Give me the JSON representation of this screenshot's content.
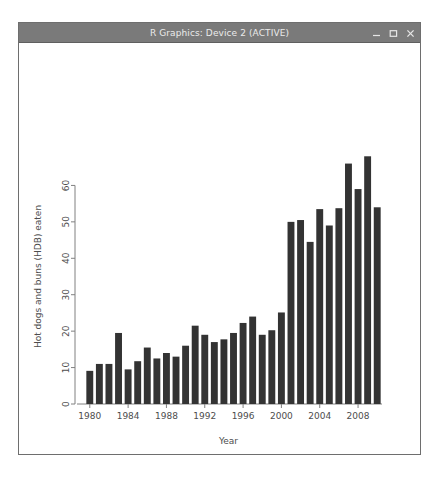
{
  "window": {
    "title": "R Graphics: Device 2 (ACTIVE)",
    "controls": [
      {
        "name": "minimize-button",
        "glyph": "minimize"
      },
      {
        "name": "maximize-button",
        "glyph": "maximize"
      },
      {
        "name": "close-button",
        "glyph": "close"
      }
    ],
    "titlebar_color": "#7a7a7a",
    "title_text_color": "#ebebeb",
    "border_color": "#6e6e6e"
  },
  "chart_data": {
    "type": "bar",
    "title": "",
    "xlabel": "Year",
    "ylabel": "Hot dogs and buns (HDB) eaten",
    "xlim": [
      1979,
      2011
    ],
    "ylim": [
      0,
      70
    ],
    "grid": false,
    "legend": null,
    "bar_color": "#333333",
    "axis_color": "#808080",
    "x_tick_labels": [
      "1980",
      "1984",
      "1988",
      "1992",
      "1996",
      "2000",
      "2004",
      "2008"
    ],
    "x_tick_values": [
      1980,
      1984,
      1988,
      1992,
      1996,
      2000,
      2004,
      2008
    ],
    "y_tick_labels": [
      "0",
      "10",
      "20",
      "30",
      "40",
      "50",
      "60"
    ],
    "y_tick_values": [
      0,
      10,
      20,
      30,
      40,
      50,
      60
    ],
    "categories": [
      1980,
      1981,
      1982,
      1983,
      1984,
      1985,
      1986,
      1987,
      1988,
      1989,
      1990,
      1991,
      1992,
      1993,
      1994,
      1995,
      1996,
      1997,
      1998,
      1999,
      2000,
      2001,
      2002,
      2003,
      2004,
      2005,
      2006,
      2007,
      2008,
      2009,
      2010
    ],
    "values": [
      9.1,
      11.0,
      11.0,
      19.5,
      9.5,
      11.75,
      15.5,
      12.5,
      14.0,
      13.0,
      16.0,
      21.5,
      19.0,
      17.0,
      17.75,
      19.5,
      22.25,
      24.0,
      19.0,
      20.25,
      25.125,
      50.0,
      50.5,
      44.5,
      53.5,
      49.0,
      53.75,
      66.0,
      59.0,
      68.0,
      54.0
    ]
  }
}
